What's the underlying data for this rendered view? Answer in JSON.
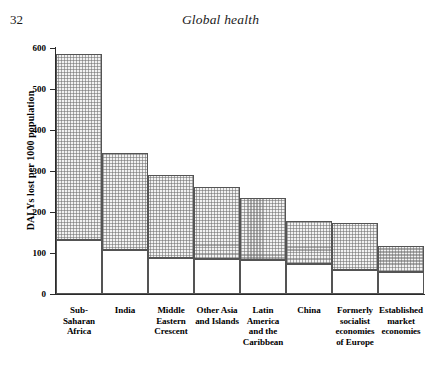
{
  "page": {
    "number": "32",
    "running_head": "Global health"
  },
  "chart_data": {
    "type": "bar",
    "stacked": true,
    "title": "",
    "xlabel": "",
    "ylabel": "DALYs lost per 1000 population",
    "ylim": [
      0,
      600
    ],
    "ytick_labels": [
      "600",
      "500",
      "400",
      "300",
      "200",
      "100",
      "0"
    ],
    "yticks": [
      600,
      500,
      400,
      300,
      200,
      100,
      0
    ],
    "grid": false,
    "legend": "none",
    "categories": [
      "Sub-\nSaharan\nAfrica",
      "India",
      "Middle\nEastern\nCrescent",
      "Other Asia\nand Islands",
      "Latin\nAmerica\nand the\nCaribbean",
      "China",
      "Formerly\nsocialist\neconomies\nof Europe",
      "Established\nmarket\neconomies"
    ],
    "category_labels": [
      [
        "Sub-",
        "Saharan",
        "Africa"
      ],
      [
        "India"
      ],
      [
        "Middle",
        "Eastern",
        "Crescent"
      ],
      [
        "Other Asia",
        "and Islands"
      ],
      [
        "Latin",
        "America",
        "and the",
        "Caribbean"
      ],
      [
        "China"
      ],
      [
        "Formerly",
        "socialist",
        "economies",
        "of Europe"
      ],
      [
        "Established",
        "market",
        "economies"
      ]
    ],
    "series": [
      {
        "name": "lower segment",
        "fill": "white",
        "values": [
          131,
          108,
          88,
          85,
          83,
          73,
          59,
          54
        ]
      },
      {
        "name": "upper segment",
        "fill": "hatched-gray",
        "values": [
          454,
          237,
          202,
          177,
          150,
          105,
          114,
          63
        ]
      }
    ],
    "totals": [
      585,
      345,
      290,
      262,
      233,
      178,
      173,
      117
    ],
    "colors": {
      "upper_fill": "#f2f2f2",
      "lower_fill": "#ffffff",
      "bar_outline": "#545454",
      "axis": "#2b2b2b"
    }
  }
}
